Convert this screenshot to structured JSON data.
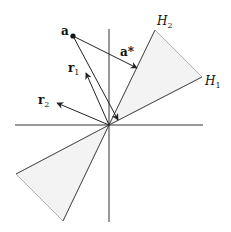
{
  "diagram": {
    "colors": {
      "line": "#222222",
      "cone_fill": "#f2f2f2",
      "cone_edge": "#999999"
    },
    "labels": {
      "a": "a",
      "a_star": "a*",
      "r1": "r",
      "r1_sub": "1",
      "r2": "r",
      "r2_sub": "2",
      "H1": "H",
      "H1_sub": "1",
      "H2": "H",
      "H2_sub": "2"
    }
  }
}
